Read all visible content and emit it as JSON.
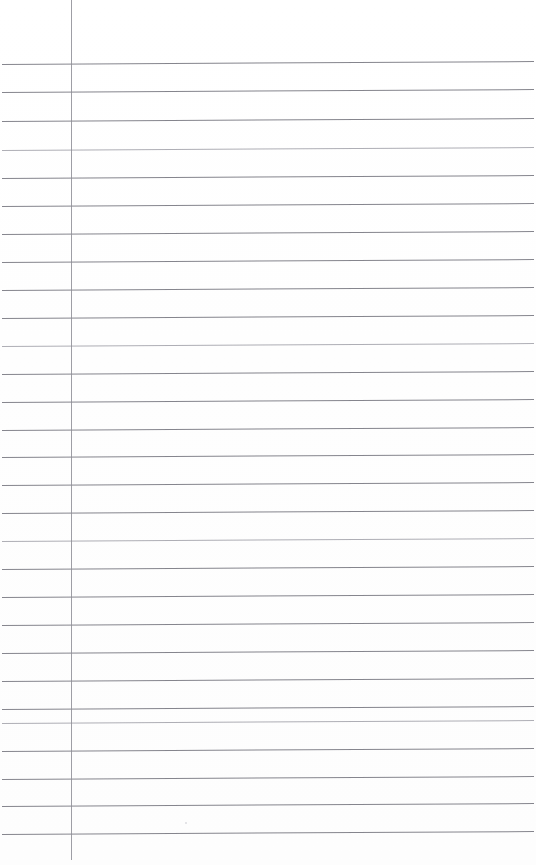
{
  "document": {
    "type": "scanned-lined-paper",
    "title": "Blank ruled notebook page",
    "page_width": 536,
    "page_height": 865,
    "background_color": "#ffffff",
    "content_text": "",
    "is_blank": true
  },
  "ruling": {
    "line_color": "#7b7b83",
    "faint_line_color": "#9a9aa2",
    "line_thickness_px": 1,
    "line_count": 28,
    "line_spacing_px": 28.5,
    "first_line_y": 64,
    "last_line_y": 834,
    "line_start_x": 2,
    "line_end_x": 534,
    "skew_degrees": -0.32,
    "horizontal_line_y_positions": [
      64,
      92,
      121,
      150,
      178,
      206,
      234,
      262,
      290,
      318,
      346,
      374,
      402,
      430,
      457,
      485,
      513,
      541,
      569,
      597,
      625,
      653,
      681,
      709,
      723,
      751,
      779,
      806,
      834
    ]
  },
  "margin_rule": {
    "name": "vertical-margin-line",
    "color": "#8d8d95",
    "x": 71,
    "top_y": 0,
    "bottom_y": 860,
    "thickness_px": 1
  },
  "artifacts": {
    "specks": [
      {
        "x": 185,
        "y": 822,
        "size": 2
      }
    ]
  }
}
